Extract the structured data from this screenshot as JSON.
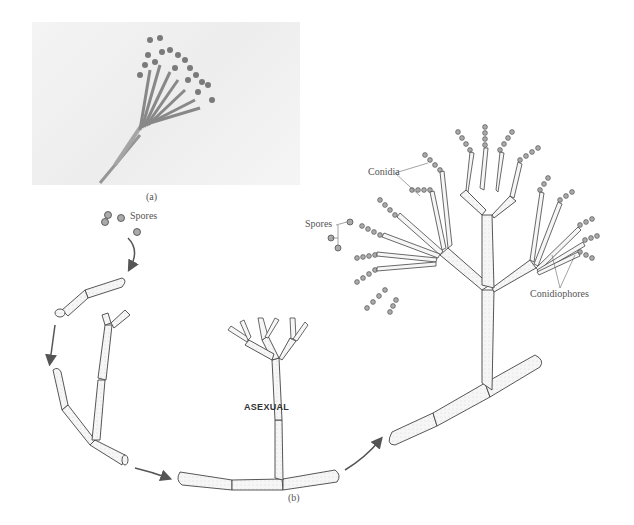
{
  "figure": {
    "panel_a": {
      "label": "(a)",
      "description": "photomicrograph of Penicillium conidiophore"
    },
    "panel_b": {
      "label": "(b)",
      "description": "asexual life cycle of Penicillium"
    }
  },
  "labels": {
    "spores_top": "Spores",
    "asexual": "ASEXUAL",
    "conidia": "Conidia",
    "spores_right": "Spores",
    "conidiophores": "Conidiophores"
  },
  "colors": {
    "line": "#444444",
    "fill": "#f4f4f4",
    "spore": "#9a9a9a",
    "arrow": "#555555",
    "text": "#555555"
  }
}
